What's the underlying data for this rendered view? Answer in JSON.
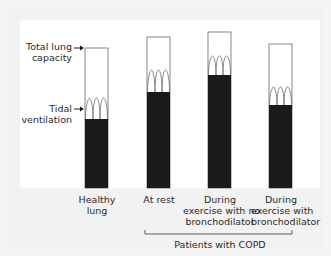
{
  "diagram": {
    "side_labels": {
      "total_lung_capacity": [
        "Total lung",
        "capacity"
      ],
      "tidal_ventilation": [
        "Tidal",
        "ventilation"
      ]
    },
    "bars": [
      {
        "label": [
          "Healthy",
          "lung"
        ],
        "top": 48,
        "wave_top": 98,
        "fill_top": 119
      },
      {
        "label": [
          "At rest"
        ],
        "top": 37,
        "wave_top": 68,
        "fill_top": 92
      },
      {
        "label": [
          "During",
          "exercise with no",
          "bronchodilator"
        ],
        "top": 32,
        "wave_top": 55,
        "fill_top": 75
      },
      {
        "label": [
          "During",
          "exercise with",
          "bronchodilator"
        ],
        "top": 44,
        "wave_top": 86,
        "fill_top": 105
      }
    ],
    "group_bracket_label": "Patients with COPD",
    "colors": {
      "fill": "#1a1a1a",
      "outline": "#6a6a6a",
      "text": "#2a2a2a"
    }
  }
}
